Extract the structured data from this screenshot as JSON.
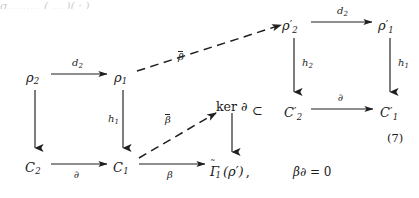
{
  "figure": {
    "equation_number": "(7)",
    "top_cut_text": "σ……… ( … )( · )",
    "nodes": [
      {
        "id": "rho2",
        "tex": "ρ",
        "sub": "2",
        "prime": false,
        "x": 30,
        "y": 78
      },
      {
        "id": "rho1",
        "tex": "ρ",
        "sub": "1",
        "prime": false,
        "x": 118,
        "y": 78
      },
      {
        "id": "C2",
        "tex": "C",
        "sub": "2",
        "prime": false,
        "x": 29,
        "y": 168
      },
      {
        "id": "C1",
        "tex": "C",
        "sub": "1",
        "prime": false,
        "x": 117,
        "y": 168
      },
      {
        "id": "rho2p",
        "tex": "ρ",
        "sub": "2",
        "prime": true,
        "x": 286,
        "y": 26
      },
      {
        "id": "rho1p",
        "tex": "ρ",
        "sub": "1",
        "prime": true,
        "x": 382,
        "y": 26
      },
      {
        "id": "C2p",
        "tex": "C",
        "sub": "2",
        "prime": true,
        "x": 288,
        "y": 113
      },
      {
        "id": "C1p",
        "tex": "C",
        "sub": "1",
        "prime": true,
        "x": 384,
        "y": 113
      }
    ],
    "kernel_node": {
      "label_ker": "ker",
      "label_del": "∂",
      "x": 222,
      "y": 105
    },
    "gamma_node": {
      "gamma": "Γ",
      "sub": "1",
      "arg": "(ρ′)",
      "comma": ",",
      "x": 213,
      "y": 172
    },
    "subset_symbol": "⊂",
    "arrow_labels": {
      "d2_left": "d",
      "d2_left_sub": "2",
      "d2_right": "d",
      "d2_right_sub": "2",
      "h1_left": "h",
      "h1_left_sub": "1",
      "h1_right": "h",
      "h1_right_sub": "1",
      "h2": "h",
      "h2_sub": "2",
      "del_bottom_left": "∂",
      "del_bottom_right": "∂",
      "beta": "β",
      "beta_bar_upper": "β",
      "beta_bar_lower": "β"
    },
    "side_equation": {
      "beta": "β",
      "del": "∂",
      "rel": "= 0"
    },
    "colors": {
      "ink": "#1a1a1a",
      "label_ink": "#242424",
      "paper": "#ffffff"
    }
  }
}
